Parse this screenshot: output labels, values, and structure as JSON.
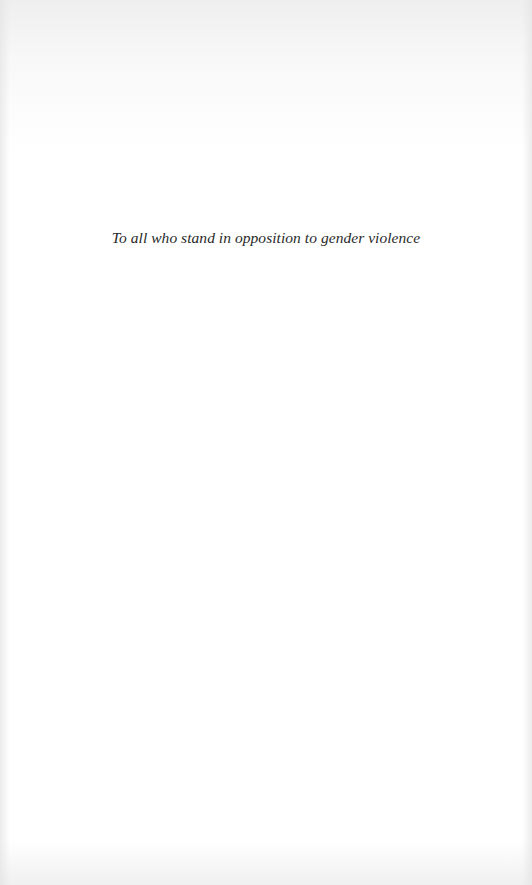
{
  "page": {
    "type": "dedication",
    "dedication_text": "To all who stand in opposition to gender violence"
  },
  "colors": {
    "background": "#ffffff",
    "text": "#2a2a2a"
  }
}
